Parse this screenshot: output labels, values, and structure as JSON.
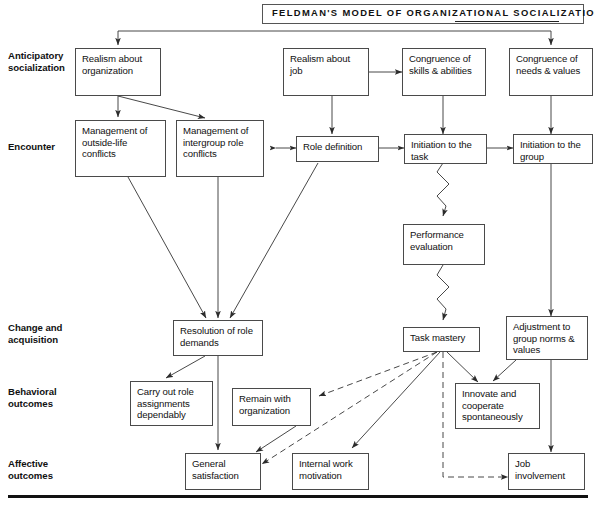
{
  "title": "Feldman's Model of Organizational Socialization",
  "stages": [
    {
      "id": "anticipatory",
      "line1": "Anticipatory",
      "line2": "socialization"
    },
    {
      "id": "encounter",
      "line1": "Encounter",
      "line2": ""
    },
    {
      "id": "change",
      "line1": "Change and",
      "line2": "acquisition"
    },
    {
      "id": "behavioral",
      "line1": "Behavioral",
      "line2": "outcomes"
    },
    {
      "id": "affective",
      "line1": "Affective",
      "line2": "outcomes"
    }
  ],
  "boxes": {
    "realism_org": "Realism about organization",
    "realism_job": "Realism about job",
    "congruence_skills": "Congruence of skills & abilities",
    "congruence_needs": "Congruence of needs & values",
    "mgmt_outside": "Management of outside-life conflicts",
    "mgmt_intergroup": "Management of intergroup role conflicts",
    "role_definition": "Role definition",
    "initiation_task": "Initiation to the task",
    "initiation_group": "Initiation to the group",
    "performance_eval": "Performance evaluation",
    "resolution_role": "Resolution of role demands",
    "task_mastery": "Task mastery",
    "adjustment_norms": "Adjustment to group norms & values",
    "carry_out_role": "Carry out role assignments dependably",
    "remain_with_org": "Remain with organization",
    "innovate_cooperate": "Innovate and cooperate spontaneously",
    "general_satisfaction": "General satisfaction",
    "internal_work_motivation": "Internal work motivation",
    "job_involvement": "Job involvement"
  },
  "colors": {
    "ink": "#111111",
    "box_border": "#4a4a4a",
    "line": "#333333",
    "background": "#ffffff"
  }
}
